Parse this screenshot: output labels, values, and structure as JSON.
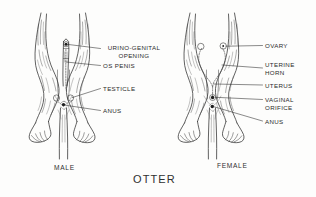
{
  "plate": {
    "title": "OTTER",
    "background_color": "#fdfdfc",
    "ink_color": "#2b2b2b"
  },
  "figures": [
    {
      "caption": "MALE",
      "labels": [
        {
          "id": "urino-genital-opening",
          "text": "URINO-GENITAL\nOPENING"
        },
        {
          "id": "os-penis",
          "text": "OS  PENIS"
        },
        {
          "id": "testicle",
          "text": "TESTICLE"
        },
        {
          "id": "anus",
          "text": "ANUS"
        }
      ]
    },
    {
      "caption": "FEMALE",
      "labels": [
        {
          "id": "ovary",
          "text": "OVARY"
        },
        {
          "id": "uterine-horn",
          "text": "UTERINE\nHORN"
        },
        {
          "id": "uterus",
          "text": "UTERUS"
        },
        {
          "id": "vaginal-orifice",
          "text": "VAGINAL\nORIFICE"
        },
        {
          "id": "anus",
          "text": "ANUS"
        }
      ]
    }
  ]
}
